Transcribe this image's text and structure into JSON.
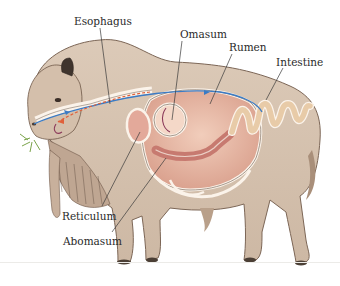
{
  "diagram": {
    "labels": [
      {
        "id": "esophagus",
        "text": "Esophagus",
        "x": 74,
        "y": 16
      },
      {
        "id": "omasum",
        "text": "Omasum",
        "x": 180,
        "y": 29
      },
      {
        "id": "rumen",
        "text": "Rumen",
        "x": 229,
        "y": 42
      },
      {
        "id": "intestine",
        "text": "Intestine",
        "x": 276,
        "y": 57
      },
      {
        "id": "reticulum",
        "text": "Reticulum",
        "x": 62,
        "y": 211
      },
      {
        "id": "abomasum",
        "text": "Abomasum",
        "x": 63,
        "y": 236
      }
    ],
    "flow_arrows": [
      {
        "name": "food-in-flow",
        "color": "#3b7bc4"
      },
      {
        "name": "regurgitation-flow",
        "color": "#e0603a"
      },
      {
        "name": "omasum-flow",
        "color": "#8b3a5a"
      }
    ],
    "colors": {
      "hide": "#d8c6b4",
      "hide_shadow": "#b9a08a",
      "rumen": "#e7b9a4",
      "intestine": "#ecd2b4",
      "outline": "#6b5a4e",
      "hoof": "#4b3f35",
      "grass": "#7aa34a"
    }
  }
}
